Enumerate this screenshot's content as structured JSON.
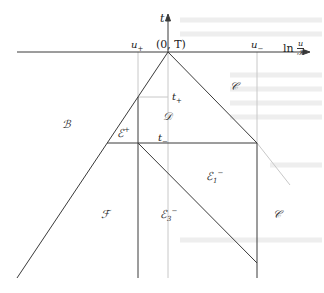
{
  "diagram": {
    "axes": {
      "vertical_label": "t",
      "horizontal_label_prefix": "ln",
      "horizontal_label_num": "u",
      "horizontal_label_den": "𝒦",
      "origin_label": "(0, T)"
    },
    "markers": {
      "u_plus": "u",
      "u_plus_sub": "+",
      "u_minus": "u",
      "u_minus_sub": "−",
      "t_plus": "t",
      "t_plus_sub": "+",
      "t_minus": "t",
      "t_minus_sub": "−"
    },
    "regions": {
      "B": "ℬ",
      "C_top": "𝒞",
      "D": "𝒟",
      "E_plus": "ℰ",
      "E_plus_sup": "+",
      "E1_minus": "ℰ",
      "E1_minus_sub": "1",
      "E1_minus_sup": "−",
      "E3_minus": "ℰ",
      "E3_minus_sub": "3",
      "E3_minus_sup": "−",
      "F": "ℱ",
      "C_bottom": "𝒞"
    },
    "colors": {
      "line": "#3a3a3a",
      "faint_line": "#c8c8c8",
      "bleed_text": "#ececec"
    }
  }
}
